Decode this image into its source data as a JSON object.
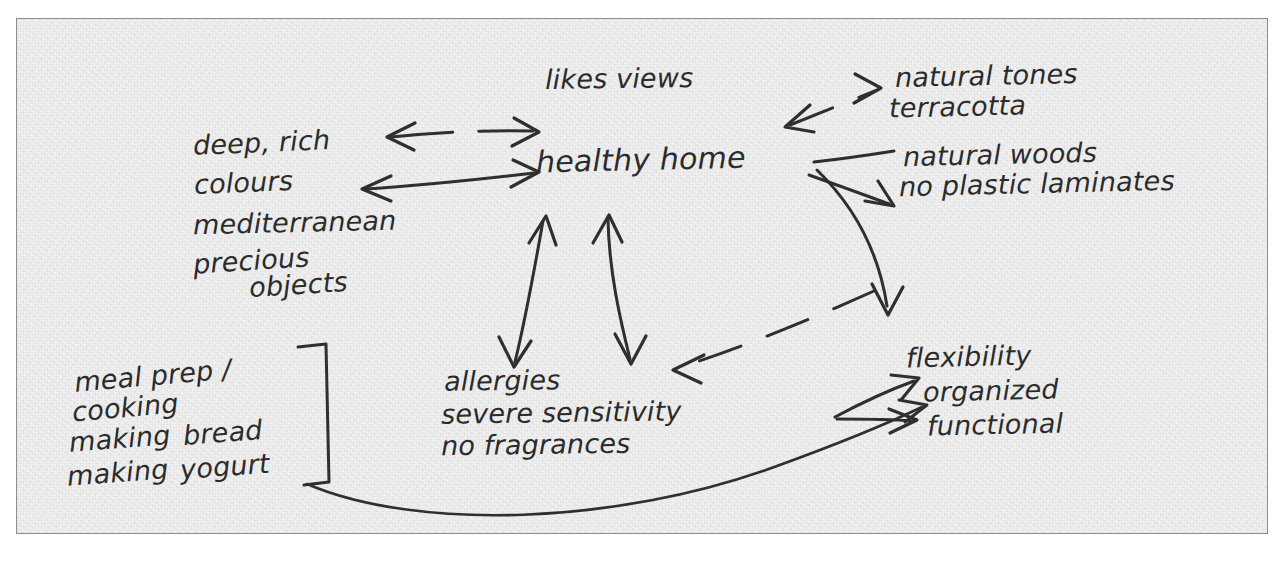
{
  "page": {
    "kind": "handwritten-mind-map",
    "paper_color": "#eeeeee",
    "ink_color": "#2f2f2f",
    "border_color": "#8e8e8e"
  },
  "nodes": {
    "center": {
      "label": "healthy home"
    },
    "likes_views": {
      "label": "likes views"
    },
    "colours": {
      "line1": "deep, rich",
      "line2": "colours",
      "line3": "mediterranean",
      "line4": "precious",
      "line5": "objects"
    },
    "materials": {
      "line1": "natural tones",
      "line2": "terracotta",
      "line3": "natural woods",
      "line4": "no plastic laminates"
    },
    "allergies": {
      "line1": "allergies",
      "line2": "severe sensitivity",
      "line3": "no fragrances"
    },
    "kitchen": {
      "line1": "meal prep /",
      "line2": "cooking",
      "line3a": "making",
      "line3b": "bread",
      "line4a": "making",
      "line4b": "yogurt"
    },
    "organization": {
      "line1": "flexibility",
      "line2": "organized",
      "line3": "functional"
    }
  },
  "connectors": [
    {
      "name": "colours-to-center-dashed",
      "style": "dashed",
      "heads": "both"
    },
    {
      "name": "colours-to-center-solid",
      "style": "solid",
      "heads": "both"
    },
    {
      "name": "center-to-natural-tones",
      "style": "dashed",
      "heads": "both"
    },
    {
      "name": "center-to-natural-woods",
      "style": "solid",
      "heads": "none"
    },
    {
      "name": "center-to-no-laminates",
      "style": "solid",
      "heads": "end"
    },
    {
      "name": "center-to-allergies-left",
      "style": "solid",
      "heads": "both"
    },
    {
      "name": "center-to-allergies-right",
      "style": "solid",
      "heads": "both"
    },
    {
      "name": "center-to-flexibility-curve",
      "style": "solid",
      "heads": "end"
    },
    {
      "name": "flexibility-to-allergies",
      "style": "dashed",
      "heads": "end"
    },
    {
      "name": "kitchen-bracket",
      "style": "solid",
      "heads": "none"
    },
    {
      "name": "kitchen-to-functional-curve",
      "style": "solid",
      "heads": "end"
    },
    {
      "name": "arrow-to-organized",
      "style": "solid",
      "heads": "end"
    },
    {
      "name": "arrow-to-functional",
      "style": "solid",
      "heads": "end"
    }
  ]
}
